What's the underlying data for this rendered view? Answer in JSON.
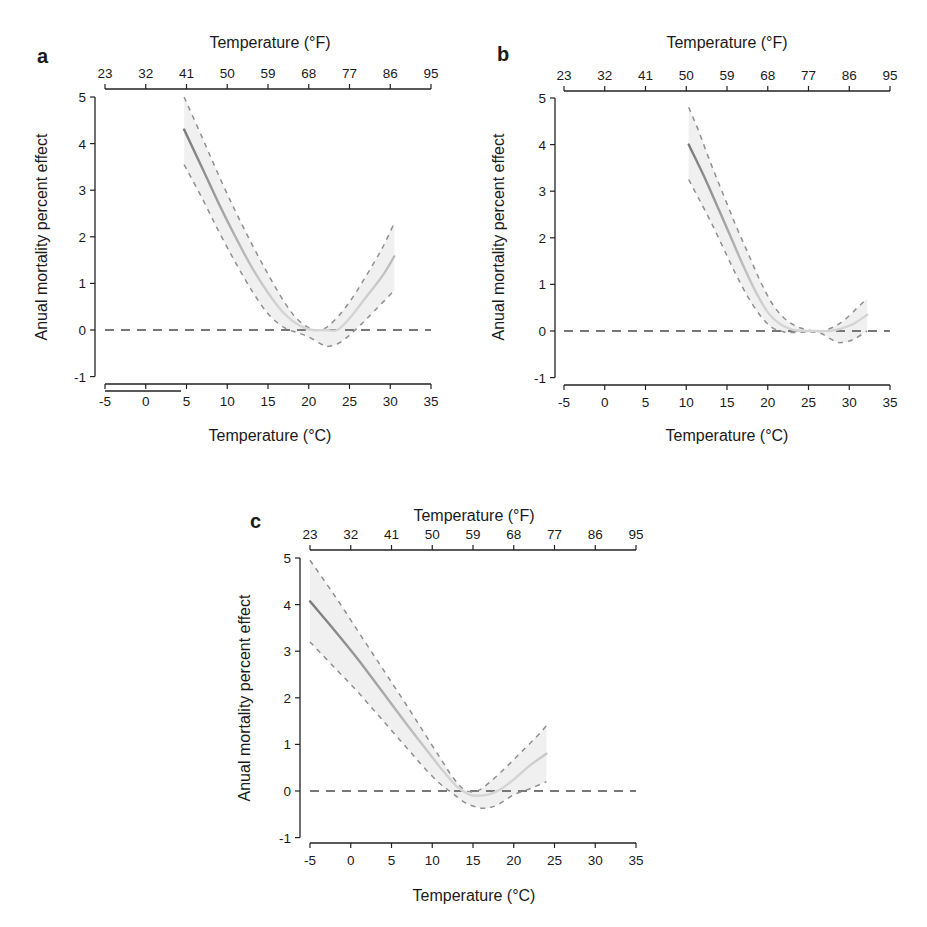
{
  "figure": {
    "panels": [
      "a",
      "b",
      "c"
    ]
  },
  "chart_data": [
    {
      "panel": "a",
      "type": "line",
      "title": "",
      "xlabel": "Temperature (°C)",
      "x2label": "Temperature (°F)",
      "ylabel": "Anual mortality percent effect",
      "xlim": [
        -5,
        35
      ],
      "ylim": [
        -1,
        5
      ],
      "x_ticks": [
        -5,
        0,
        5,
        10,
        15,
        20,
        25,
        30,
        35
      ],
      "x2_ticks": [
        23,
        32,
        41,
        50,
        59,
        68,
        77,
        86,
        95
      ],
      "y_ticks": [
        -1,
        0,
        1,
        2,
        3,
        4,
        5
      ],
      "grid": false,
      "reference_line": {
        "y": 0,
        "style": "dashed"
      },
      "series": [
        {
          "name": "effect",
          "style": "solid",
          "x": [
            4.7,
            7,
            9,
            11,
            13,
            15,
            17,
            19,
            20.5,
            22,
            23.5,
            25,
            27,
            29,
            30.5
          ],
          "y": [
            4.3,
            3.45,
            2.7,
            2.0,
            1.35,
            0.8,
            0.35,
            0.08,
            0.0,
            0.0,
            0.0,
            0.25,
            0.7,
            1.15,
            1.58
          ]
        },
        {
          "name": "upper_ci",
          "style": "dashed",
          "x": [
            4.7,
            7,
            9,
            11,
            13,
            15,
            17,
            18.5,
            20,
            21.5,
            23,
            25,
            27,
            29,
            30.5
          ],
          "y": [
            5.0,
            4.1,
            3.3,
            2.55,
            1.85,
            1.2,
            0.6,
            0.25,
            0.05,
            0.0,
            0.18,
            0.6,
            1.15,
            1.75,
            2.3
          ]
        },
        {
          "name": "lower_ci",
          "style": "dashed",
          "x": [
            4.7,
            7,
            9,
            11,
            13,
            15,
            17,
            18.5,
            20,
            21.5,
            22.5,
            24,
            26,
            28,
            30.5
          ],
          "y": [
            3.55,
            2.8,
            2.1,
            1.45,
            0.85,
            0.35,
            0.05,
            -0.05,
            -0.15,
            -0.3,
            -0.35,
            -0.25,
            0.05,
            0.4,
            0.85
          ]
        }
      ]
    },
    {
      "panel": "b",
      "type": "line",
      "title": "",
      "xlabel": "Temperature (°C)",
      "x2label": "Temperature (°F)",
      "ylabel": "Anual mortality percent effect",
      "xlim": [
        -5,
        35
      ],
      "ylim": [
        -1,
        5
      ],
      "x_ticks": [
        -5,
        0,
        5,
        10,
        15,
        20,
        25,
        30,
        35
      ],
      "x2_ticks": [
        23,
        32,
        41,
        50,
        59,
        68,
        77,
        86,
        95
      ],
      "y_ticks": [
        -1,
        0,
        1,
        2,
        3,
        4,
        5
      ],
      "grid": false,
      "reference_line": {
        "y": 0,
        "style": "dashed"
      },
      "series": [
        {
          "name": "effect",
          "style": "solid",
          "x": [
            10.3,
            11,
            12.5,
            14,
            15.5,
            17,
            18.5,
            20,
            21.5,
            23,
            24.5,
            26,
            27.5,
            29,
            30.5,
            32.2
          ],
          "y": [
            4.0,
            3.75,
            3.2,
            2.6,
            2.0,
            1.4,
            0.85,
            0.4,
            0.15,
            0.03,
            0.0,
            0.0,
            0.0,
            0.05,
            0.15,
            0.35
          ]
        },
        {
          "name": "upper_ci",
          "style": "dashed",
          "x": [
            10.3,
            11.5,
            13,
            14.5,
            16,
            17.5,
            19,
            20.5,
            22,
            23.5,
            25,
            26.5,
            28,
            29.5,
            31,
            32.2
          ],
          "y": [
            4.8,
            4.3,
            3.6,
            2.95,
            2.3,
            1.7,
            1.1,
            0.6,
            0.28,
            0.1,
            0.02,
            0.0,
            0.08,
            0.25,
            0.5,
            0.7
          ]
        },
        {
          "name": "lower_ci",
          "style": "dashed",
          "x": [
            10.3,
            11.5,
            13,
            14.5,
            16,
            17.5,
            19,
            20.5,
            22,
            23.5,
            25,
            26.5,
            28,
            29,
            30.5,
            32.2
          ],
          "y": [
            3.25,
            2.85,
            2.35,
            1.8,
            1.25,
            0.75,
            0.35,
            0.08,
            -0.02,
            -0.03,
            -0.02,
            -0.05,
            -0.2,
            -0.25,
            -0.18,
            0.0
          ]
        }
      ]
    },
    {
      "panel": "c",
      "type": "line",
      "title": "",
      "xlabel": "Temperature (°C)",
      "x2label": "Temperature (°F)",
      "ylabel": "Anual mortality percent effect",
      "xlim": [
        -5,
        35
      ],
      "ylim": [
        -1,
        5
      ],
      "x_ticks": [
        -5,
        0,
        5,
        10,
        15,
        20,
        25,
        30,
        35
      ],
      "x2_ticks": [
        23,
        32,
        41,
        50,
        59,
        68,
        77,
        86,
        95
      ],
      "y_ticks": [
        -1,
        0,
        1,
        2,
        3,
        4,
        5
      ],
      "grid": false,
      "reference_line": {
        "y": 0,
        "style": "dashed"
      },
      "series": [
        {
          "name": "effect",
          "style": "solid",
          "x": [
            -5,
            -2,
            1,
            4,
            7,
            9,
            11,
            13,
            14.5,
            15.5,
            17,
            18.5,
            20,
            22,
            24
          ],
          "y": [
            4.07,
            3.45,
            2.8,
            2.1,
            1.4,
            0.95,
            0.5,
            0.1,
            -0.07,
            -0.1,
            -0.07,
            0.05,
            0.25,
            0.55,
            0.8
          ]
        },
        {
          "name": "upper_ci",
          "style": "dashed",
          "x": [
            -5,
            -2,
            1,
            4,
            7,
            9,
            11,
            12.5,
            14,
            15.5,
            17,
            19,
            21,
            23,
            24
          ],
          "y": [
            4.95,
            4.2,
            3.4,
            2.6,
            1.8,
            1.25,
            0.7,
            0.3,
            0.02,
            0.0,
            0.18,
            0.5,
            0.85,
            1.2,
            1.4
          ]
        },
        {
          "name": "lower_ci",
          "style": "dashed",
          "x": [
            -5,
            -2,
            1,
            4,
            7,
            9,
            11,
            12.5,
            14,
            15.5,
            16.5,
            18,
            20,
            22,
            24
          ],
          "y": [
            3.2,
            2.65,
            2.1,
            1.5,
            0.9,
            0.5,
            0.15,
            -0.05,
            -0.25,
            -0.35,
            -0.37,
            -0.3,
            -0.08,
            0.05,
            0.2
          ]
        }
      ]
    }
  ],
  "panels": {
    "a": {
      "letter": "a",
      "x2_title": "Temperature (°F)",
      "x_title": "Temperature (°C)",
      "y_title": "Anual mortality percent effect"
    },
    "b": {
      "letter": "b",
      "x2_title": "Temperature (°F)",
      "x_title": "Temperature (°C)",
      "y_title": "Anual mortality percent effect"
    },
    "c": {
      "letter": "c",
      "x2_title": "Temperature (°F)",
      "x_title": "Temperature (°C)",
      "y_title": "Anual mortality percent effect"
    }
  },
  "colors": {
    "axis": "#222222",
    "main_line_dark": "#7a7a7a",
    "main_line_light": "#d4d4d4",
    "ci_line": "#8f8f8f",
    "ci_band": "#ececec",
    "zero_line": "#777777"
  }
}
